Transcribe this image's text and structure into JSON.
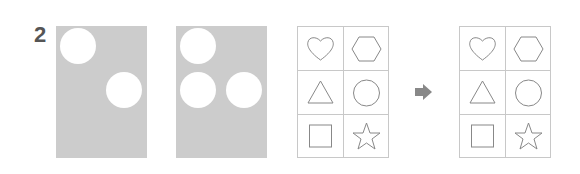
{
  "problem": {
    "number": "2",
    "panels": [
      {
        "id": "panel-1",
        "holes": [
          {
            "cx": 22,
            "cy": 20,
            "r": 18
          },
          {
            "cx": 68,
            "cy": 64,
            "r": 18
          }
        ]
      },
      {
        "id": "panel-2",
        "holes": [
          {
            "cx": 22,
            "cy": 20,
            "r": 18
          },
          {
            "cx": 22,
            "cy": 64,
            "r": 18
          },
          {
            "cx": 68,
            "cy": 64,
            "r": 18
          }
        ]
      }
    ],
    "grids": [
      {
        "id": "grid-before",
        "shapes": [
          "heart",
          "hexagon",
          "triangle",
          "circle",
          "square",
          "star"
        ]
      },
      {
        "id": "grid-after",
        "shapes": [
          "heart",
          "hexagon",
          "triangle",
          "circle",
          "square",
          "star"
        ]
      }
    ],
    "arrow_icon": "right-arrow-icon",
    "colors": {
      "panel": "#cccccc",
      "stroke": "#888888",
      "grid_line": "#c8c8c8",
      "arrow": "#888888",
      "number": "#555555"
    }
  }
}
